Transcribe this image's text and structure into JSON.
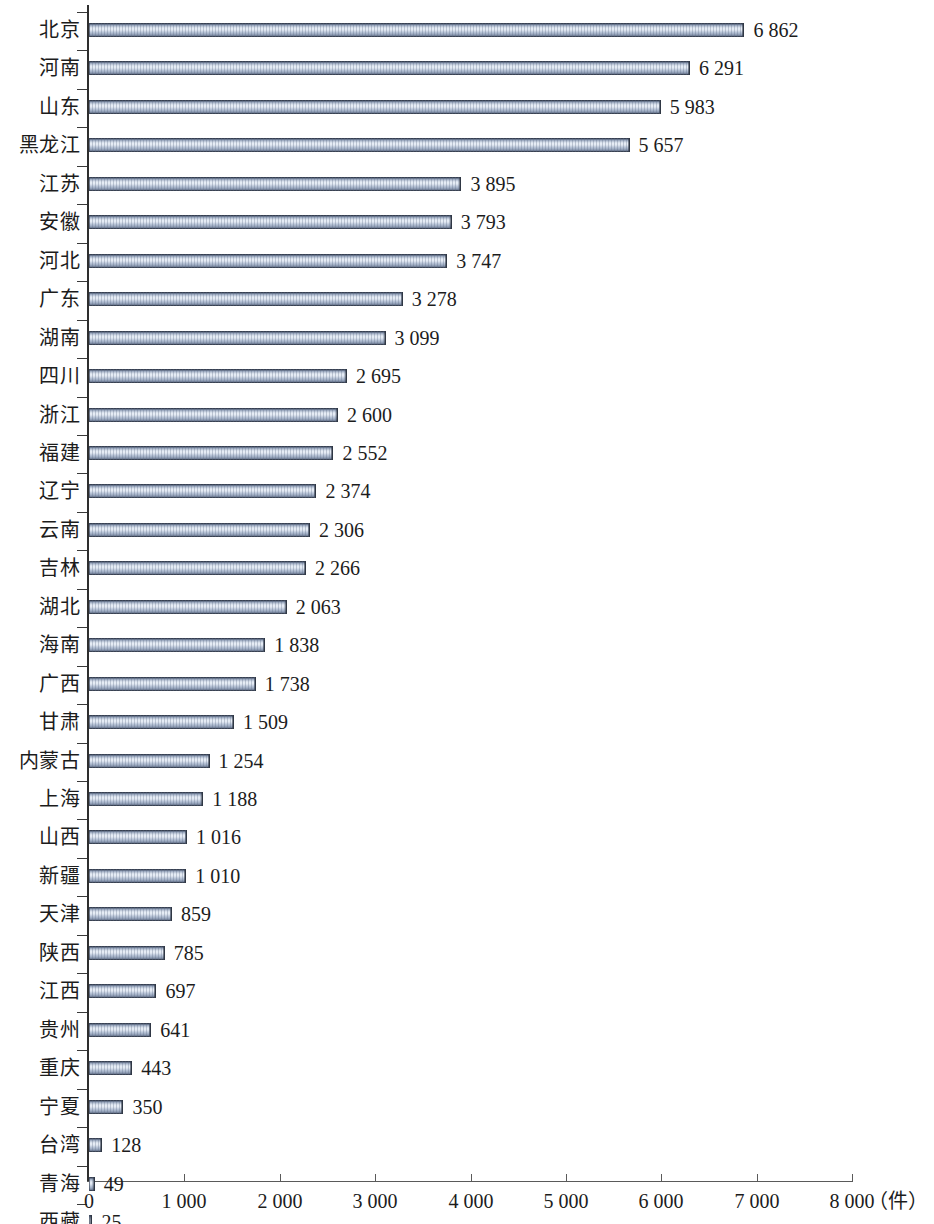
{
  "chart_data": {
    "type": "bar",
    "orientation": "horizontal",
    "title": "",
    "subtitle": "",
    "xlabel": "（件）",
    "ylabel": "",
    "xlim": [
      0,
      8000
    ],
    "xticks": [
      "0",
      "1 000",
      "2 000",
      "3 000",
      "4 000",
      "5 000",
      "6 000",
      "7 000",
      "8 000"
    ],
    "xtick_values": [
      0,
      1000,
      2000,
      3000,
      4000,
      5000,
      6000,
      7000,
      8000
    ],
    "grid": false,
    "legend": null,
    "thousands_separator": " ",
    "categories": [
      "北京",
      "河南",
      "山东",
      "黑龙江",
      "江苏",
      "安徽",
      "河北",
      "广东",
      "湖南",
      "四川",
      "浙江",
      "福建",
      "辽宁",
      "云南",
      "吉林",
      "湖北",
      "海南",
      "广西",
      "甘肃",
      "内蒙古",
      "上海",
      "山西",
      "新疆",
      "天津",
      "陕西",
      "江西",
      "贵州",
      "重庆",
      "宁夏",
      "台湾",
      "青海",
      "西藏"
    ],
    "values": [
      6862,
      6291,
      5983,
      5657,
      3895,
      3793,
      3747,
      3278,
      3099,
      2695,
      2600,
      2552,
      2374,
      2306,
      2266,
      2063,
      1838,
      1738,
      1509,
      1254,
      1188,
      1016,
      1010,
      859,
      785,
      697,
      641,
      443,
      350,
      128,
      49,
      25
    ],
    "value_labels": [
      "6 862",
      "6 291",
      "5 983",
      "5 657",
      "3 895",
      "3 793",
      "3 747",
      "3 278",
      "3 099",
      "2 695",
      "2 600",
      "2 552",
      "2 374",
      "2 306",
      "2 266",
      "2 063",
      "1 838",
      "1 738",
      "1 509",
      "1 254",
      "1 188",
      "1 016",
      "1 010",
      "859",
      "785",
      "697",
      "641",
      "443",
      "350",
      "128",
      "49",
      "25"
    ],
    "colors": {
      "bar_face_light": "#eaf0f8",
      "bar_face_mid": "#b9c5d8",
      "bar_edge_dark": "#39414f",
      "axis": "#2e2e2e",
      "text": "#1c1c1c",
      "background": "#ffffff"
    }
  }
}
